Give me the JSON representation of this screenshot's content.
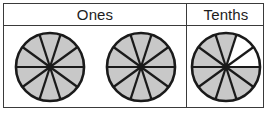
{
  "table": {
    "columns": [
      {
        "id": "ones",
        "label": "Ones"
      },
      {
        "id": "tenths",
        "label": "Tenths"
      }
    ]
  },
  "colors": {
    "shaded": "#c8c8c8",
    "unshaded": "#ffffff",
    "stroke": "#1a1a1a",
    "border": "#3a3a3a",
    "text": "#1d1d1d"
  },
  "chart_data": {
    "type": "pie",
    "title": "",
    "xlabel": "",
    "ylabel": "",
    "sectors_per_circle": 10,
    "sector_angle_degrees": 36,
    "value_represented": "2.8",
    "circles": [
      {
        "id": "ones-circle-1",
        "column": "Ones",
        "total_sectors": 10,
        "shaded_sectors": 10,
        "unshaded_sectors": 0,
        "fraction": "10/10",
        "value": 1
      },
      {
        "id": "ones-circle-2",
        "column": "Ones",
        "total_sectors": 10,
        "shaded_sectors": 10,
        "unshaded_sectors": 0,
        "fraction": "10/10",
        "value": 1
      },
      {
        "id": "tenths-circle-1",
        "column": "Tenths",
        "total_sectors": 10,
        "shaded_sectors": 8,
        "unshaded_sectors": 2,
        "fraction": "8/10",
        "value": 0.8
      }
    ],
    "legend": [],
    "grid": false
  }
}
